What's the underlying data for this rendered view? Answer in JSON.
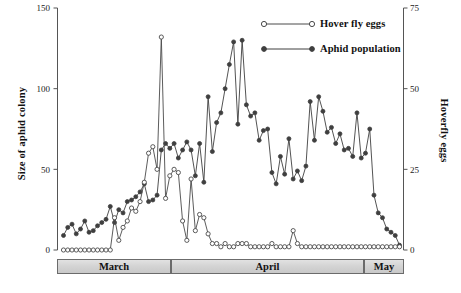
{
  "chart_data": {
    "type": "line",
    "title": "",
    "xlabel": "",
    "ylabel": "Size of aphid colony",
    "y2label": "Hoverfly eggs",
    "ylim": [
      0,
      150
    ],
    "y2lim": [
      0,
      75
    ],
    "grid": false,
    "legend_position": "top-right",
    "yticks": [
      "0",
      "50",
      "100",
      "150"
    ],
    "ytick_values": [
      0,
      50,
      100,
      150
    ],
    "y2ticks": [
      "0",
      "25",
      "50",
      "75"
    ],
    "y2tick_values": [
      0,
      25,
      50,
      75
    ],
    "x_category_labels": [
      "March",
      "April",
      "May"
    ],
    "x_category_spans": [
      [
        0,
        33
      ],
      [
        33,
        72
      ],
      [
        72,
        86
      ]
    ],
    "series": [
      {
        "name": "Aphid population",
        "axis": "left",
        "marker": "filled-circle",
        "color": "#3f3f3f",
        "values": [
          9,
          14,
          16,
          10,
          13,
          18,
          11,
          12,
          15,
          17,
          19,
          27,
          17,
          25,
          23,
          30,
          31,
          33,
          36,
          41,
          30,
          31,
          34,
          62,
          66,
          63,
          66,
          57,
          62,
          67,
          62,
          46,
          66,
          42,
          95,
          61,
          79,
          85,
          100,
          115,
          129,
          78,
          130,
          90,
          83,
          85,
          68,
          74,
          75,
          48,
          41,
          58,
          47,
          69,
          44,
          49,
          43,
          52,
          92,
          68,
          95,
          86,
          73,
          76,
          66,
          72,
          62,
          63,
          58,
          85,
          57,
          60,
          75,
          34,
          23,
          20,
          13,
          11,
          9,
          3
        ]
      },
      {
        "name": "Hover fly eggs",
        "axis": "right",
        "marker": "open-circle",
        "color": "#4a4a4a",
        "values": [
          0,
          0,
          0,
          0,
          0,
          0,
          0,
          0,
          0,
          0,
          0,
          0,
          10,
          3,
          7,
          9,
          13,
          12,
          15,
          21,
          30,
          32,
          25,
          66,
          16,
          23,
          25,
          24,
          9,
          3,
          22,
          6,
          11,
          10,
          5,
          2,
          2,
          1,
          2,
          1,
          1,
          2,
          2,
          2,
          1,
          1,
          1,
          1,
          1,
          2,
          1,
          1,
          1,
          1,
          6,
          2,
          1,
          1,
          1,
          1,
          1,
          1,
          1,
          1,
          1,
          1,
          1,
          1,
          1,
          1,
          1,
          1,
          1,
          1,
          1,
          1,
          1,
          1,
          1,
          1
        ]
      }
    ]
  },
  "legend": {
    "items": [
      {
        "label": "Hover fly eggs",
        "marker": "open-circle"
      },
      {
        "label": "Aphid population",
        "marker": "filled-circle"
      }
    ]
  },
  "axes": {
    "left_title": "Size of aphid colony",
    "right_title": "Hoverfly eggs",
    "left_ticks": [
      "150",
      "100",
      "50",
      "0"
    ],
    "right_ticks": [
      "75",
      "50",
      "25",
      "0"
    ]
  },
  "months": [
    {
      "label": "March"
    },
    {
      "label": "April"
    },
    {
      "label": "May"
    }
  ]
}
